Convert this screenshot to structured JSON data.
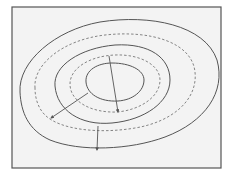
{
  "diagram": {
    "title": "",
    "colors": {
      "background": "#ffffff",
      "panel": "#f3f3f3",
      "frame": "#555555",
      "line": "#555555",
      "dashed": "#777777"
    },
    "contours": [
      {
        "id": "outer-solid",
        "style": "solid"
      },
      {
        "id": "outer-dashed",
        "style": "dashed"
      },
      {
        "id": "middle-solid",
        "style": "solid"
      },
      {
        "id": "inner-dashed",
        "style": "dashed"
      },
      {
        "id": "inner-solid",
        "style": "solid"
      }
    ],
    "arrows": [
      {
        "id": "arrow-diagonal-left",
        "from": "inner-solid",
        "to": "outer-dashed"
      },
      {
        "id": "arrow-vertical-center",
        "from": "inner-dashed-top",
        "to": "inner-dashed-bottom"
      },
      {
        "id": "arrow-vertical-bottom",
        "from": "middle-solid",
        "to": "outer-solid"
      }
    ]
  }
}
